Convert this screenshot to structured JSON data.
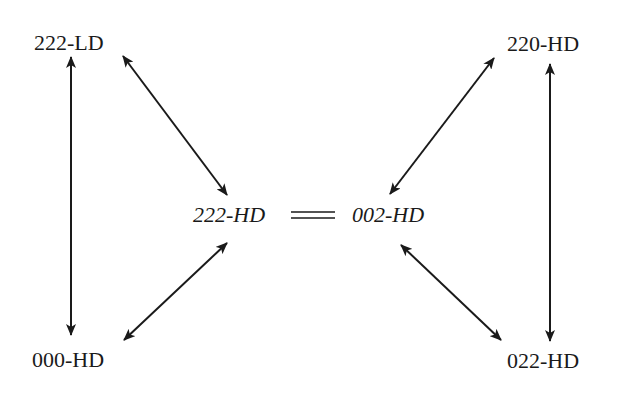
{
  "diagram": {
    "type": "state-relationship",
    "colors": {
      "ink": "#1a1a1a",
      "background": "#ffffff"
    },
    "nodes": {
      "top_left": {
        "label": "222-LD",
        "style": "upright"
      },
      "top_right": {
        "label": "220-HD",
        "style": "upright"
      },
      "bottom_left": {
        "label": "000-HD",
        "style": "upright"
      },
      "bottom_right": {
        "label": "022-HD",
        "style": "upright"
      },
      "center_left": {
        "label": "222-HD",
        "style": "italic"
      },
      "center_right": {
        "label": "002-HD",
        "style": "italic"
      }
    },
    "equivalence": {
      "symbol": "=",
      "between": [
        "222-HD",
        "002-HD"
      ]
    },
    "edges": [
      {
        "from": "222-LD",
        "to": "000-HD",
        "type": "bidirectional"
      },
      {
        "from": "222-LD",
        "to": "222-HD",
        "type": "bidirectional"
      },
      {
        "from": "000-HD",
        "to": "222-HD",
        "type": "bidirectional"
      },
      {
        "from": "220-HD",
        "to": "022-HD",
        "type": "bidirectional"
      },
      {
        "from": "220-HD",
        "to": "002-HD",
        "type": "bidirectional"
      },
      {
        "from": "022-HD",
        "to": "002-HD",
        "type": "bidirectional"
      }
    ]
  }
}
